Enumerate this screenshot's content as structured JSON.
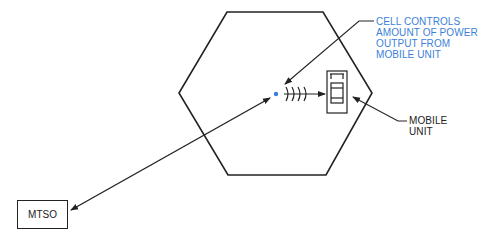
{
  "diagram": {
    "nodes": {
      "cell": {
        "shape": "hexagon"
      },
      "cell_site": {
        "shape": "dot",
        "color": "#3b7fd9"
      },
      "mobile_unit": {
        "shape": "phone"
      },
      "mtso": {
        "label": "MTSO"
      }
    },
    "annotations": {
      "cell_controls": {
        "lines": [
          "CELL CONTROLS",
          "AMOUNT OF POWER",
          "OUTPUT FROM",
          "MOBILE UNIT"
        ],
        "color": "#3b7fd9"
      },
      "mobile_unit": {
        "lines": [
          "MOBILE",
          "UNIT"
        ],
        "color": "#222222"
      }
    },
    "edges": [
      {
        "from": "mtso",
        "to": "cell_site",
        "type": "bidirectional"
      },
      {
        "from": "cell_site",
        "to": "mobile_unit",
        "type": "radio-signal"
      }
    ]
  }
}
